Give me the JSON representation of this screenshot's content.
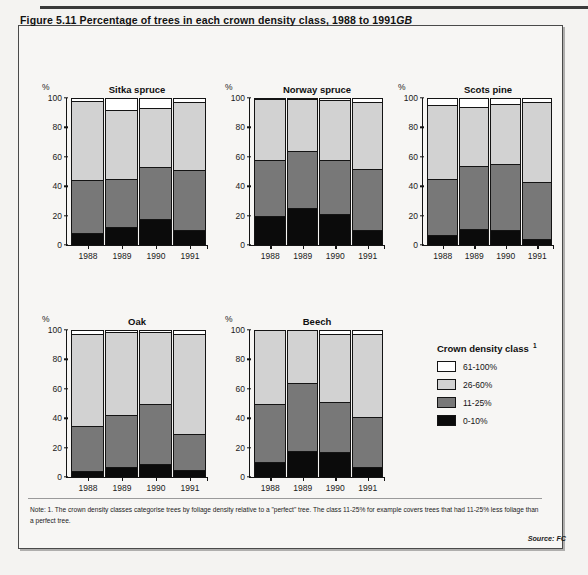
{
  "figure": {
    "title_main": "Figure 5.11   Percentage of trees in each crown density class, 1988 to 1991",
    "title_suffix": "GB"
  },
  "axis": {
    "percent_symbol": "%",
    "yticks": [
      "100",
      "80",
      "60",
      "40",
      "20",
      "0"
    ],
    "years": [
      "1988",
      "1989",
      "1990",
      "1991"
    ]
  },
  "legend": {
    "title": "Crown density class",
    "footnote_marker": "1",
    "items": [
      {
        "label": "61-100%",
        "color": "#ffffff",
        "key": "s61"
      },
      {
        "label": "26-60%",
        "color": "#d2d2d2",
        "key": "s26"
      },
      {
        "label": "11-25%",
        "color": "#787878",
        "key": "s11"
      },
      {
        "label": "0-10%",
        "color": "#0b0b0b",
        "key": "s0"
      }
    ]
  },
  "note": {
    "text": "Note: 1. The crown density classes categorise trees by foliage density relative to a \"perfect\" tree. The class 11-25% for example covers trees that had 11-25% less foliage than a perfect tree.",
    "source": "Source: FC"
  },
  "chart_data": {
    "type": "bar",
    "stacked": true,
    "title": "Percentage of trees in each crown density class, 1988 to 1991",
    "xlabel": "",
    "ylabel": "%",
    "ylim": [
      0,
      100
    ],
    "yticks": [
      0,
      20,
      40,
      60,
      80,
      100
    ],
    "grid": false,
    "legend_position": "right-bottom",
    "legend_title": "Crown density class",
    "categories": [
      "1988",
      "1989",
      "1990",
      "1991"
    ],
    "series_order": [
      "0-10%",
      "11-25%",
      "26-60%",
      "61-100%"
    ],
    "series_colors": {
      "0-10%": "#0b0b0b",
      "11-25%": "#787878",
      "26-60%": "#d2d2d2",
      "61-100%": "#ffffff"
    },
    "panels": [
      {
        "name": "Sitka spruce",
        "series": [
          {
            "name": "0-10%",
            "values": [
              8,
              12,
              18,
              10
            ]
          },
          {
            "name": "11-25%",
            "values": [
              36,
              33,
              35,
              41
            ]
          },
          {
            "name": "26-60%",
            "values": [
              54,
              47,
              40,
              46
            ]
          },
          {
            "name": "61-100%",
            "values": [
              2,
              8,
              7,
              3
            ]
          }
        ],
        "cumulative_tops": {
          "0-10%": [
            8,
            12,
            18,
            10
          ],
          "11-25%": [
            44,
            45,
            53,
            51
          ],
          "26-60%": [
            98,
            92,
            93,
            97
          ],
          "61-100%": [
            100,
            100,
            100,
            100
          ]
        }
      },
      {
        "name": "Norway spruce",
        "series": [
          {
            "name": "0-10%",
            "values": [
              20,
              25,
              21,
              10
            ]
          },
          {
            "name": "11-25%",
            "values": [
              38,
              39,
              37,
              42
            ]
          },
          {
            "name": "26-60%",
            "values": [
              41,
              35,
              41,
              45
            ]
          },
          {
            "name": "61-100%",
            "values": [
              1,
              1,
              1,
              3
            ]
          }
        ],
        "cumulative_tops": {
          "0-10%": [
            20,
            25,
            21,
            10
          ],
          "11-25%": [
            58,
            64,
            58,
            52
          ],
          "26-60%": [
            99,
            99,
            99,
            97
          ],
          "61-100%": [
            100,
            100,
            100,
            100
          ]
        }
      },
      {
        "name": "Scots pine",
        "series": [
          {
            "name": "0-10%",
            "values": [
              7,
              11,
              10,
              4
            ]
          },
          {
            "name": "11-25%",
            "values": [
              38,
              43,
              45,
              39
            ]
          },
          {
            "name": "26-60%",
            "values": [
              50,
              40,
              41,
              54
            ]
          },
          {
            "name": "61-100%",
            "values": [
              5,
              6,
              4,
              3
            ]
          }
        ],
        "cumulative_tops": {
          "0-10%": [
            7,
            11,
            10,
            4
          ],
          "11-25%": [
            45,
            54,
            55,
            43
          ],
          "26-60%": [
            95,
            94,
            96,
            97
          ],
          "61-100%": [
            100,
            100,
            100,
            100
          ]
        }
      },
      {
        "name": "Oak",
        "series": [
          {
            "name": "0-10%",
            "values": [
              4,
              7,
              9,
              5
            ]
          },
          {
            "name": "11-25%",
            "values": [
              31,
              35,
              41,
              24
            ]
          },
          {
            "name": "26-60%",
            "values": [
              62,
              57,
              49,
              68
            ]
          },
          {
            "name": "61-100%",
            "values": [
              3,
              1,
              1,
              3
            ]
          }
        ],
        "cumulative_tops": {
          "0-10%": [
            4,
            7,
            9,
            5
          ],
          "11-25%": [
            35,
            42,
            50,
            29
          ],
          "26-60%": [
            97,
            99,
            99,
            97
          ],
          "61-100%": [
            100,
            100,
            100,
            100
          ]
        }
      },
      {
        "name": "Beech",
        "series": [
          {
            "name": "0-10%",
            "values": [
              10,
              18,
              17,
              7
            ]
          },
          {
            "name": "11-25%",
            "values": [
              40,
              46,
              34,
              34
            ]
          },
          {
            "name": "26-60%",
            "values": [
              50,
              36,
              46,
              56
            ]
          },
          {
            "name": "61-100%",
            "values": [
              0,
              0,
              3,
              3
            ]
          }
        ],
        "cumulative_tops": {
          "0-10%": [
            10,
            18,
            17,
            7
          ],
          "11-25%": [
            50,
            64,
            51,
            41
          ],
          "26-60%": [
            100,
            100,
            97,
            97
          ],
          "61-100%": [
            100,
            100,
            100,
            100
          ]
        }
      }
    ]
  },
  "layout": {
    "panels_px": [
      {
        "left": 66,
        "top": 98,
        "w": 142,
        "h": 148
      },
      {
        "left": 249,
        "top": 98,
        "w": 136,
        "h": 148
      },
      {
        "left": 422,
        "top": 98,
        "w": 132,
        "h": 148
      },
      {
        "left": 66,
        "top": 330,
        "w": 142,
        "h": 148
      },
      {
        "left": 249,
        "top": 330,
        "w": 136,
        "h": 148
      }
    ]
  }
}
